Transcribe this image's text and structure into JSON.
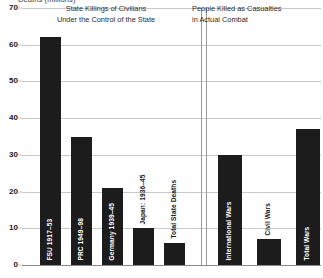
{
  "chart_data": {
    "type": "bar",
    "title": "",
    "ylabel": "Deaths (millions)",
    "xlabel": "",
    "ylim": [
      0,
      70
    ],
    "yticks": [
      0,
      10,
      20,
      30,
      40,
      50,
      60,
      70
    ],
    "grid": true,
    "legend": false,
    "panels": [
      {
        "title_lines": [
          "State Killings of Civilians",
          "Under the Control of the State"
        ],
        "categories": [
          "FSU 1917–53",
          "PRC 1949–98",
          "Germany 1939–45",
          "Japan: 1936–45",
          "Total State Deaths"
        ],
        "values": [
          62,
          35,
          21,
          10,
          6
        ]
      },
      {
        "title_lines": [
          "People Killed as Casualties",
          "in Actual Combat"
        ],
        "categories": [
          "International Wars",
          "Civil Wars",
          "Total Wars"
        ],
        "values": [
          30,
          7,
          37
        ]
      }
    ]
  },
  "axis": {
    "y_title": "Deaths (millions)",
    "tick_labels": [
      "70",
      "60",
      "50",
      "40",
      "30",
      "20",
      "10",
      "0"
    ]
  },
  "panel_left": {
    "title_line_1": "State Killings of Civilians",
    "title_line_2": "Under the Control of the State",
    "bars": [
      {
        "label": "FSU 1917–53",
        "value": 62,
        "label_placement": "inside"
      },
      {
        "label": "PRC 1949–98",
        "value": 35,
        "label_placement": "inside"
      },
      {
        "label": "Germany 1939–45",
        "value": 21,
        "label_placement": "inside"
      },
      {
        "label": "Japan: 1936–45",
        "value": 10,
        "label_placement": "outside"
      },
      {
        "label": "Total State Deaths",
        "value": 6,
        "label_placement": "outside"
      }
    ]
  },
  "panel_right": {
    "title_line_1": "People Killed as Casualties",
    "title_line_2": "in Actual Combat",
    "bars": [
      {
        "label": "International Wars",
        "value": 30,
        "label_placement": "inside"
      },
      {
        "label": "Civil Wars",
        "value": 7,
        "label_placement": "outside"
      },
      {
        "label": "Total Wars",
        "value": 37,
        "label_placement": "inside"
      }
    ]
  },
  "colors": {
    "bar": "#1c1c1c",
    "grid": "#c9c9c9",
    "baseline": "#8a8a8a",
    "divider": "#9a9a9a",
    "text": "#1a1a1a"
  }
}
